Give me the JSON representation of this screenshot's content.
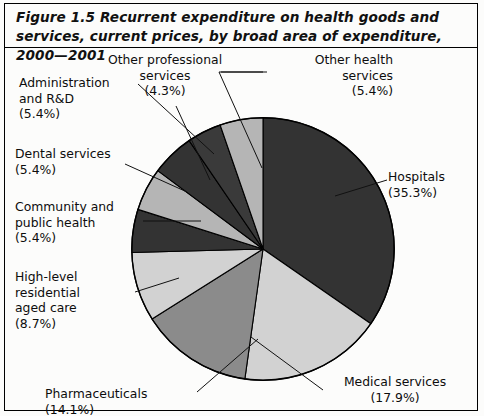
{
  "figure": {
    "title": "Figure 1.5 Recurrent expenditure on health goods and services, current prices, by broad area of expenditure, 2000—2001"
  },
  "chart_data": {
    "type": "pie",
    "title": "Figure 1.5 Recurrent expenditure on health goods and services, current prices, by broad area of expenditure, 2000—2001",
    "xlabel": "",
    "ylabel": "",
    "value_unit": "percent",
    "legend": "none",
    "grid": false,
    "categories": [
      "Hospitals",
      "Medical services",
      "Pharmaceuticals",
      "High-level residential aged care",
      "Community and public health",
      "Dental services",
      "Administration and R&D",
      "Other professional services",
      "Other health services"
    ],
    "values": [
      35.3,
      17.9,
      14.1,
      8.7,
      5.4,
      5.4,
      5.4,
      4.3,
      5.4
    ],
    "slices": [
      {
        "label": "Hospitals",
        "value": 35.3,
        "value_text": "(35.3%)",
        "color": "#333333"
      },
      {
        "label": "Medical services",
        "value": 17.9,
        "value_text": "(17.9%)",
        "color": "#d2d2d2"
      },
      {
        "label": "Pharmaceuticals",
        "value": 14.1,
        "value_text": "(14.1%)",
        "color": "#8b8b8b"
      },
      {
        "label": "High-level residential aged care",
        "value": 8.7,
        "value_text": "(8.7%)",
        "color": "#d2d2d2"
      },
      {
        "label": "Community and public health",
        "value": 5.4,
        "value_text": "(5.4%)",
        "color": "#333333"
      },
      {
        "label": "Dental services",
        "value": 5.4,
        "value_text": "(5.4%)",
        "color": "#b5b5b5"
      },
      {
        "label": "Administration and R&D",
        "value": 5.4,
        "value_text": "(5.4%)",
        "color": "#333333"
      },
      {
        "label": "Other professional services",
        "value": 4.3,
        "value_text": "(4.3%)",
        "color": "#3a3a3a"
      },
      {
        "label": "Other health services",
        "value": 5.4,
        "value_text": "(5.4%)",
        "color": "#b5b5b5"
      }
    ]
  },
  "labels": {
    "other_professional_services": "Other professional\nservices\n(4.3%)",
    "other_health_services": "Other health\nservices\n(5.4%)",
    "hospitals": "Hospitals\n(35.3%)",
    "medical_services": "Medical services\n(17.9%)",
    "pharmaceuticals": "Pharmaceuticals\n(14.1%)",
    "high_level_residential_aged_care": "High-level\nresidential\naged care\n(8.7%)",
    "community_and_public_health": "Community and\npublic health\n(5.4%)",
    "dental_services": "Dental services\n(5.4%)",
    "administration_and_rd": "Administration\nand R&D\n(5.4%)"
  },
  "colors": {
    "dark": "#333333",
    "mid_gray": "#8b8b8b",
    "light_gray": "#d2d2d2",
    "mid_light_gray": "#b5b5b5",
    "outline": "#000000",
    "background": "#fcfcfb"
  }
}
